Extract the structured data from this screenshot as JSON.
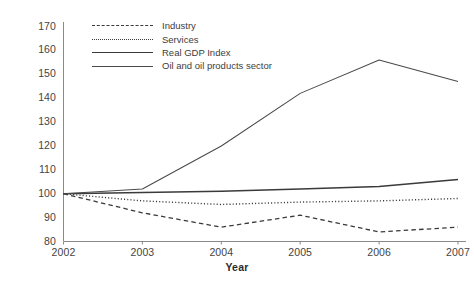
{
  "chart_data": {
    "type": "line",
    "title": "",
    "xlabel": "Year",
    "ylabel": "",
    "categories": [
      "2002",
      "2003",
      "2004",
      "2005",
      "2006",
      "2007"
    ],
    "x": [
      2002,
      2003,
      2004,
      2005,
      2006,
      2007
    ],
    "ylim": [
      80,
      170
    ],
    "xlim": [
      2002,
      2007
    ],
    "yticks": [
      80,
      90,
      100,
      110,
      120,
      130,
      140,
      150,
      160,
      170
    ],
    "ytick_labels": [
      "80",
      "90",
      "100",
      "110",
      "120",
      "130",
      "140",
      "150",
      "160",
      "170"
    ],
    "xtick_labels": [
      "2002",
      "2003",
      "2004",
      "2005",
      "2006",
      "2007"
    ],
    "grid": false,
    "legend_position": "top-left-inside",
    "series": [
      {
        "name": "Industry",
        "style": "dashed",
        "color": "#3a3a3a",
        "values": [
          100,
          92,
          86,
          91,
          84,
          86
        ]
      },
      {
        "name": "Services",
        "style": "dotted",
        "color": "#3a3a3a",
        "values": [
          100,
          97,
          95.5,
          96.5,
          97,
          98
        ]
      },
      {
        "name": "Real GDP Index",
        "style": "solid-thick",
        "color": "#3a3a3a",
        "values": [
          100,
          100.5,
          101,
          102,
          103,
          106
        ]
      },
      {
        "name": "Oil and oil products sector",
        "style": "solid-thin",
        "color": "#4a4a4a",
        "values": [
          100,
          102,
          120,
          142,
          156,
          147
        ]
      }
    ]
  },
  "legend": {
    "items": [
      {
        "label": "Industry"
      },
      {
        "label": "Services"
      },
      {
        "label": "Real GDP Index"
      },
      {
        "label": "Oil and oil products sector"
      }
    ]
  },
  "axes": {
    "x_title": "Year"
  }
}
